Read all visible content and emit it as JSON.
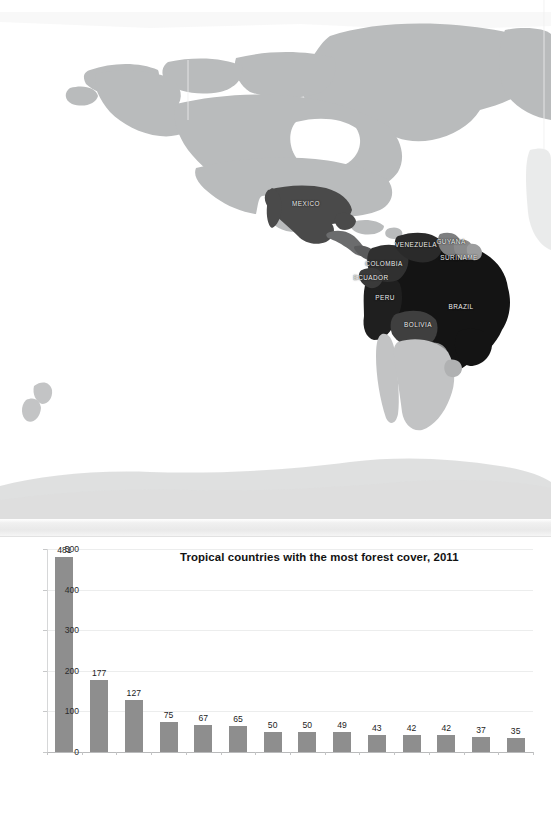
{
  "map": {
    "name": "world-map-tropical-forest",
    "ocean_color": "#ffffff",
    "land_color": "#b9bbbc",
    "land_pale_color": "#d9dadb",
    "labels": [
      {
        "text": "MEXICO",
        "x": 306,
        "y": 203,
        "shade": "#4a4a4a"
      },
      {
        "text": "VENEZUELA",
        "x": 416,
        "y": 244,
        "shade": "#2a2a2a"
      },
      {
        "text": "GUYANA",
        "x": 451,
        "y": 241,
        "shade": "#7d7e7f"
      },
      {
        "text": "SURINAME",
        "x": 459,
        "y": 257,
        "shade": "#8a8b8c"
      },
      {
        "text": "COLOMBIA",
        "x": 384,
        "y": 263,
        "shade": "#303030"
      },
      {
        "text": "ECUADOR",
        "x": 371,
        "y": 277,
        "shade": "#3a3a3a"
      },
      {
        "text": "PERU",
        "x": 385,
        "y": 297,
        "shade": "#1f1f1f"
      },
      {
        "text": "BRAZIL",
        "x": 461,
        "y": 306,
        "shade": "#141414"
      },
      {
        "text": "BOLIVIA",
        "x": 418,
        "y": 324,
        "shade": "#3f3f3f"
      }
    ]
  },
  "chart_data": {
    "type": "bar",
    "title": "Tropical countries with the most forest cover, 2011",
    "xlabel": "",
    "ylabel": "",
    "ylim": [
      0,
      500
    ],
    "yticks": [
      0,
      100,
      200,
      300,
      400,
      500
    ],
    "grid": true,
    "legend": null,
    "bar_color": "#8e8e8e",
    "data_labels": true,
    "categories": [
      "Brazil",
      "DR Congo",
      "Indonesia",
      "Peru",
      "Colombia",
      "Bolivia",
      "Angola",
      "Venezuela",
      "Mexico",
      "India",
      "CAR",
      "Myanmar",
      "PNG",
      "Mozambique"
    ],
    "values": [
      481,
      177,
      127,
      75,
      67,
      65,
      50,
      50,
      49,
      43,
      42,
      42,
      37,
      35
    ]
  }
}
